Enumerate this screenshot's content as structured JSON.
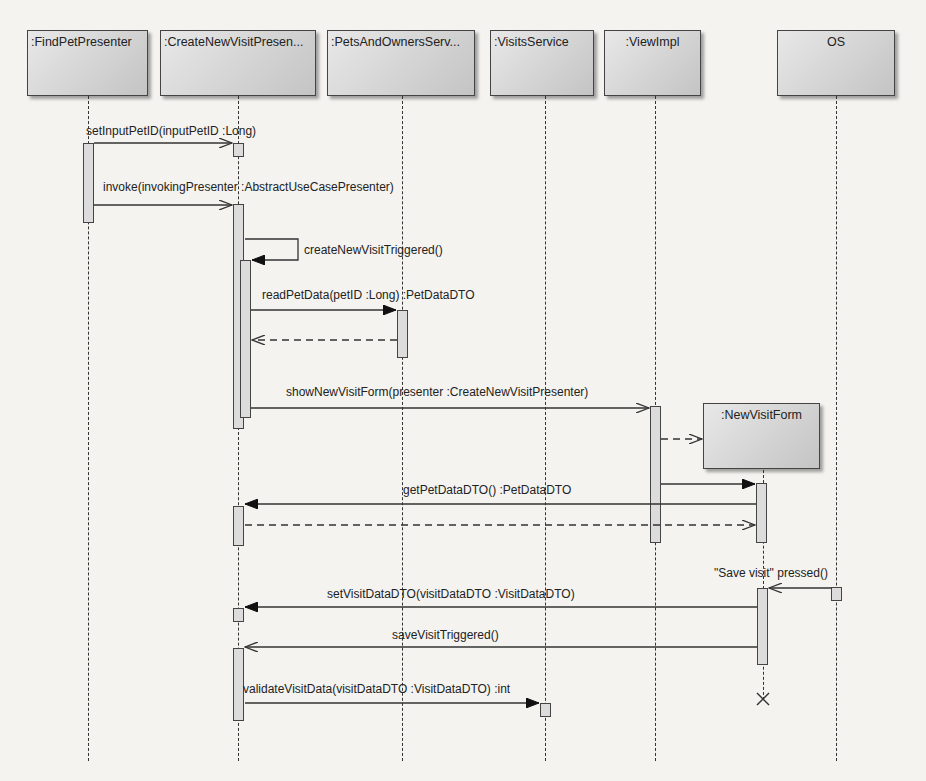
{
  "diagram": {
    "type": "UML sequence diagram",
    "lifelines": [
      {
        "id": "findpet",
        "label": ":FindPetPresenter"
      },
      {
        "id": "createvisit",
        "label": ":CreateNewVisitPresen..."
      },
      {
        "id": "petsowners",
        "label": ":PetsAndOwnersServ..."
      },
      {
        "id": "visits",
        "label": ":VisitsService"
      },
      {
        "id": "viewimpl",
        "label": ":ViewImpl"
      },
      {
        "id": "os",
        "label": "OS"
      },
      {
        "id": "newvisitform",
        "label": ":NewVisitForm"
      }
    ],
    "messages": [
      {
        "label": "setInputPetID(inputPetID :Long)",
        "from": "findpet",
        "to": "createvisit",
        "kind": "async"
      },
      {
        "label": "invoke(invokingPresenter :AbstractUseCasePresenter)",
        "from": "findpet",
        "to": "createvisit",
        "kind": "async"
      },
      {
        "label": "createNewVisitTriggered()",
        "from": "createvisit",
        "to": "createvisit",
        "kind": "sync-self"
      },
      {
        "label": "readPetData(petID :Long) :PetDataDTO",
        "from": "createvisit",
        "to": "petsowners",
        "kind": "sync"
      },
      {
        "label": "",
        "from": "petsowners",
        "to": "createvisit",
        "kind": "return"
      },
      {
        "label": "showNewVisitForm(presenter :CreateNewVisitPresenter)",
        "from": "createvisit",
        "to": "viewimpl",
        "kind": "async"
      },
      {
        "label": "",
        "from": "viewimpl",
        "to": "newvisitform",
        "kind": "create"
      },
      {
        "label": "",
        "from": "viewimpl",
        "to": "newvisitform",
        "kind": "sync"
      },
      {
        "label": "getPetDataDTO() :PetDataDTO",
        "from": "newvisitform",
        "to": "createvisit",
        "kind": "sync"
      },
      {
        "label": "",
        "from": "createvisit",
        "to": "newvisitform",
        "kind": "return"
      },
      {
        "label": "\"Save visit\" pressed()",
        "from": "os",
        "to": "newvisitform",
        "kind": "async"
      },
      {
        "label": "setVisitDataDTO(visitDataDTO :VisitDataDTO)",
        "from": "newvisitform",
        "to": "createvisit",
        "kind": "sync"
      },
      {
        "label": "saveVisitTriggered()",
        "from": "newvisitform",
        "to": "createvisit",
        "kind": "async"
      },
      {
        "label": "validateVisitData(visitDataDTO :VisitDataDTO) :int",
        "from": "createvisit",
        "to": "visits",
        "kind": "sync"
      }
    ],
    "destroy": {
      "lifeline": "newvisitform",
      "symbol": "X"
    }
  }
}
